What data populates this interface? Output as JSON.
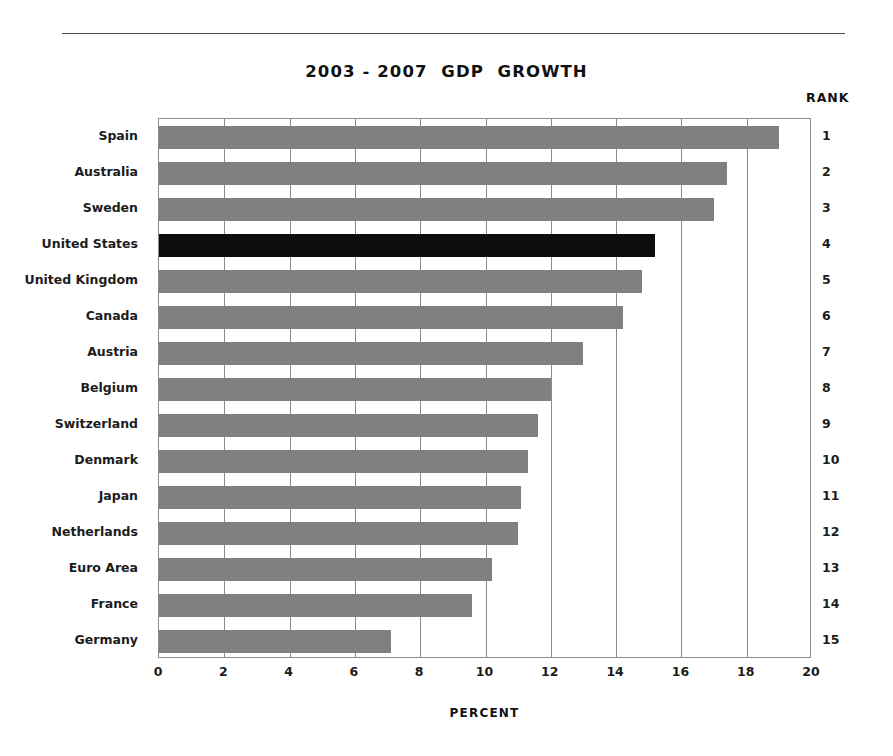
{
  "header": {
    "title": "2003 - 2007  GDP  GROWTH",
    "rank_header": "RANK"
  },
  "chart_data": {
    "type": "bar",
    "orientation": "horizontal",
    "title": "2003 - 2007  GDP  GROWTH",
    "xlabel": "PERCENT",
    "ylabel": "",
    "xlim": [
      0,
      20
    ],
    "xticks": [
      "0",
      "2",
      "4",
      "6",
      "8",
      "10",
      "12",
      "14",
      "16",
      "18",
      "20"
    ],
    "grid": "vertical",
    "legend": "none",
    "highlight_category": "United States",
    "highlight_color": "#0d0d0d",
    "bar_color": "#808080",
    "rank_column_label": "RANK",
    "categories": [
      "Spain",
      "Australia",
      "Sweden",
      "United States",
      "United Kingdom",
      "Canada",
      "Austria",
      "Belgium",
      "Switzerland",
      "Denmark",
      "Japan",
      "Netherlands",
      "Euro Area",
      "France",
      "Germany"
    ],
    "values": [
      19.0,
      17.4,
      17.0,
      15.2,
      14.8,
      14.2,
      13.0,
      12.0,
      11.6,
      11.3,
      11.1,
      11.0,
      10.2,
      9.6,
      7.1
    ],
    "ranks": [
      "1",
      "2",
      "3",
      "4",
      "5",
      "6",
      "7",
      "8",
      "9",
      "10",
      "11",
      "12",
      "13",
      "14",
      "15"
    ]
  }
}
